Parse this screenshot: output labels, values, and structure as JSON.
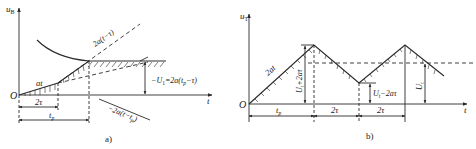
{
  "panel_a": {
    "caption": "a)",
    "y_axis_label": "u",
    "y_axis_sub": "B",
    "x_axis_label": "t",
    "origin_label": "O",
    "slope_label_1": "at",
    "slope_label_2": "2a(t−τ)",
    "slope_label_3": "−2a(t−t",
    "slope_label_3_sub": "p",
    "slope_label_3_end": ")",
    "u1_label": "U",
    "u1_sub": "1",
    "u1_expr": "=2a(t",
    "u1_expr_sub": "p",
    "u1_expr_end": "−τ)",
    "dim_1": "2τ",
    "dim_2": "t",
    "dim_2_sub": "p"
  },
  "panel_b": {
    "caption": "b)",
    "y_axis_label": "u",
    "y_axis_sub": "T",
    "x_axis_label": "t",
    "origin_label": "O",
    "slope_label": "2at",
    "peak_label": "U",
    "peak_sub": "t",
    "peak_expr": "+2aτ",
    "valley_label": "U",
    "valley_sub": "t",
    "valley_expr": "−2aτ",
    "ut_label": "U",
    "ut_sub": "t",
    "dim_1": "t",
    "dim_1_sub": "p",
    "dim_2": "2τ",
    "dim_3": "2τ"
  },
  "colors": {
    "line": "#2a2a2a",
    "background": "#ffffff"
  }
}
